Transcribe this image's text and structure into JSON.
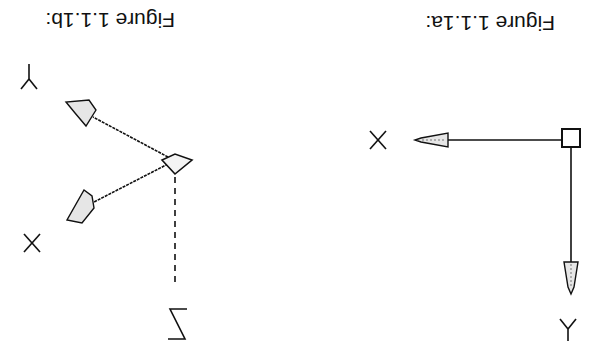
{
  "orientation": "rotated-180",
  "figures": [
    {
      "id": "fig-a",
      "caption": "Figure 1.1.1a:",
      "axes": {
        "x_label": "X",
        "y_label": "Y"
      },
      "description": "2D UCS icon: square origin marker with X arrow and Y arrow"
    },
    {
      "id": "fig-b",
      "caption": "Figure 1.1.1b:",
      "axes": {
        "x_label": "X",
        "y_label": "Y",
        "z_label": "Z"
      },
      "description": "3D UCS icon: diamond origin with X and Y arrows, dashed Z line"
    }
  ],
  "colors": {
    "ink": "#111111",
    "background": "#ffffff",
    "fill": "#dddddd"
  }
}
